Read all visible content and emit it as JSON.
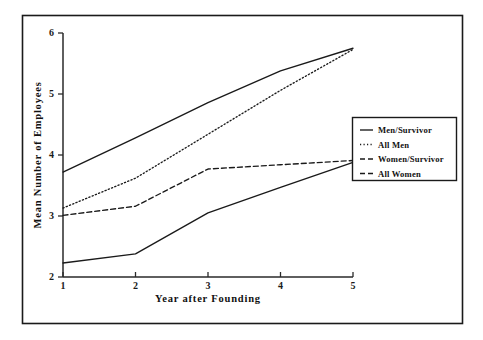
{
  "chart_data": {
    "type": "line",
    "title": "",
    "xlabel": "Year after Founding",
    "ylabel": "Mean Number of Employees",
    "x": [
      1,
      2,
      3,
      4,
      5
    ],
    "xlim": [
      1,
      5
    ],
    "ylim": [
      2,
      6
    ],
    "xticks": [
      "1",
      "2",
      "3",
      "4",
      "5"
    ],
    "yticks": [
      "2",
      "3",
      "4",
      "5",
      "6"
    ],
    "grid": false,
    "legend_position": "right",
    "series": [
      {
        "name": "Men/Survivor",
        "style": "solid",
        "values": [
          3.72,
          4.28,
          4.86,
          5.38,
          5.75
        ]
      },
      {
        "name": "All Men",
        "style": "dotted",
        "values": [
          3.13,
          3.62,
          4.34,
          5.06,
          5.73
        ]
      },
      {
        "name": "Women/Survivor",
        "style": "dashed",
        "values": [
          3.01,
          3.16,
          3.77,
          3.84,
          3.91
        ]
      },
      {
        "name": "All Women",
        "style": "solid",
        "values": [
          2.23,
          2.38,
          3.05,
          3.47,
          3.88
        ]
      }
    ]
  },
  "axes": {
    "x_title": "Year after Founding",
    "y_title": "Mean Number of Employees",
    "x_tick_labels": [
      "1",
      "2",
      "3",
      "4",
      "5"
    ],
    "y_tick_labels": [
      "2",
      "3",
      "4",
      "5",
      "6"
    ]
  },
  "legend": {
    "entries": [
      {
        "label": "Men/Survivor",
        "style": "solid"
      },
      {
        "label": "All Men",
        "style": "dotted"
      },
      {
        "label": "Women/Survivor",
        "style": "dashed"
      },
      {
        "label": "All Women",
        "style": "dashed"
      }
    ]
  },
  "colors": {
    "ink": "#1a1a1a",
    "background": "#ffffff",
    "frame": "#1a1a1a"
  }
}
